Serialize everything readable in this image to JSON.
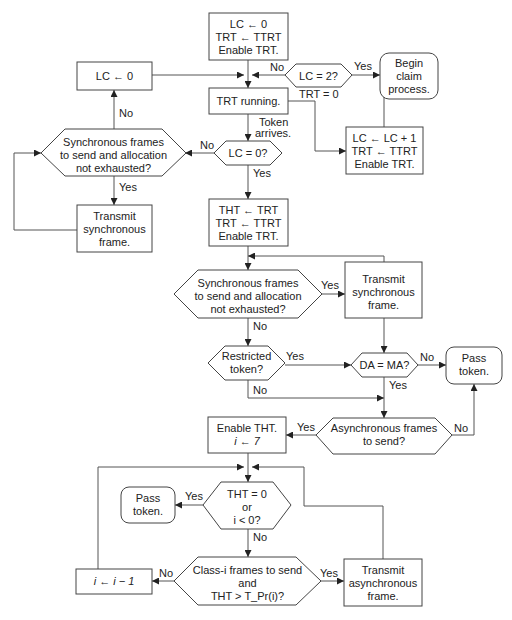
{
  "diagram": {
    "type": "flowchart",
    "nodes": {
      "init": {
        "shape": "box",
        "lines": [
          "LC ← 0",
          "TRT ← TTRT",
          "Enable TRT."
        ]
      },
      "reset_lc": {
        "shape": "box",
        "lines": [
          "LC ← 0"
        ]
      },
      "lc_eq_2": {
        "shape": "hexagon",
        "lines": [
          "LC = 2?"
        ]
      },
      "begin_claim": {
        "shape": "rounded",
        "lines": [
          "Begin",
          "claim",
          "process."
        ]
      },
      "trt_running": {
        "shape": "box",
        "lines": [
          "TRT running."
        ]
      },
      "lc_eq_0": {
        "shape": "hexagon",
        "lines": [
          "LC = 0?"
        ]
      },
      "lc_inc": {
        "shape": "box",
        "lines": [
          "LC ← LC + 1",
          "TRT ← TTRT",
          "Enable TRT."
        ]
      },
      "sync_left": {
        "shape": "hexagon",
        "lines": [
          "Synchronous frames",
          "to send and allocation",
          "not exhausted?"
        ]
      },
      "transmit_sync_left": {
        "shape": "box",
        "lines": [
          "Transmit",
          "synchronous",
          "frame."
        ]
      },
      "tht_assign": {
        "shape": "box",
        "lines": [
          "THT ← TRT",
          "TRT ← TTRT",
          "Enable TRT."
        ]
      },
      "sync_mid": {
        "shape": "hexagon",
        "lines": [
          "Synchronous frames",
          "to send and allocation",
          "not exhausted?"
        ]
      },
      "transmit_sync_right": {
        "shape": "box",
        "lines": [
          "Transmit",
          "synchronous",
          "frame."
        ]
      },
      "restricted": {
        "shape": "hexagon",
        "lines": [
          "Restricted",
          "token?"
        ]
      },
      "da_ma": {
        "shape": "hexagon",
        "lines": [
          "DA = MA?"
        ]
      },
      "pass_token_right": {
        "shape": "rounded",
        "lines": [
          "Pass",
          "token."
        ]
      },
      "async_send": {
        "shape": "hexagon",
        "lines": [
          "Asynchronous frames",
          "to send?"
        ]
      },
      "enable_tht": {
        "shape": "box",
        "lines": [
          "Enable THT.",
          "i ← 7"
        ]
      },
      "tht_zero": {
        "shape": "hexagon",
        "lines": [
          "THT = 0",
          "or",
          "i < 0?"
        ]
      },
      "pass_token_left": {
        "shape": "rounded",
        "lines": [
          "Pass",
          "token."
        ]
      },
      "class_i": {
        "shape": "hexagon",
        "lines": [
          "Class-i frames to send",
          "and",
          "THT > T_Pr(i)?"
        ]
      },
      "dec_i": {
        "shape": "box",
        "lines": [
          "i ← i − 1"
        ]
      },
      "transmit_async": {
        "shape": "box",
        "lines": [
          "Transmit",
          "asynchronous",
          "frame."
        ]
      }
    },
    "edge_labels": {
      "lc2_no": "No",
      "lc2_yes": "Yes",
      "trt_zero": "TRT = 0",
      "token_arrives_1": "Token",
      "token_arrives_2": "arrives.",
      "lc0_no": "No",
      "lc0_yes": "Yes",
      "syncleft_no": "No",
      "syncleft_yes": "Yes",
      "syncmid_yes": "Yes",
      "syncmid_no": "No",
      "restricted_yes": "Yes",
      "restricted_no": "No",
      "dama_no": "No",
      "dama_yes": "Yes",
      "async_yes": "Yes",
      "async_no": "No",
      "thtzero_yes": "Yes",
      "thtzero_no": "No",
      "classi_no": "No",
      "classi_yes": "Yes"
    }
  }
}
